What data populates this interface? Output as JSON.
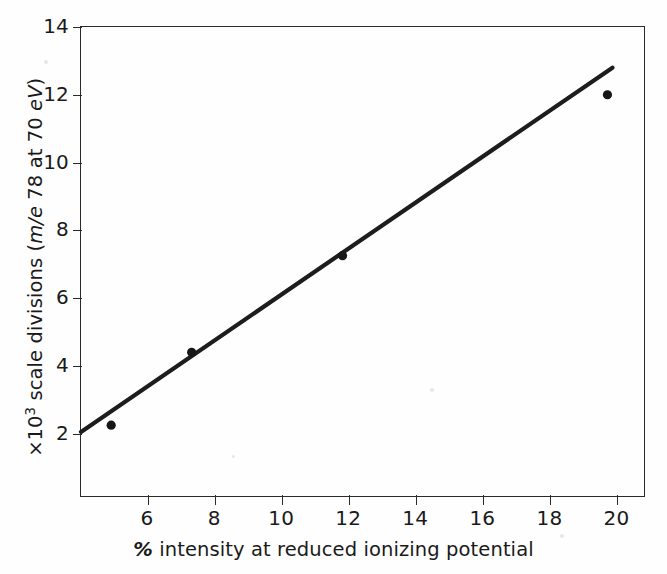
{
  "figure": {
    "background_color": "#fefefe",
    "ink_color": "#2a2a2a"
  },
  "chart_data": {
    "type": "scatter",
    "title": "",
    "subtitle": "",
    "xlabel": "% intensity at reduced ionizing potential",
    "ylabel": "×10³ scale divisions (m/e 78 at 70 eV)",
    "ylabel_parts": {
      "prefix": "×10",
      "exponent": "3",
      "middle": " scale divisions (",
      "italic_1": "m/e",
      "middle_2": " 78 at 70 ",
      "italic_2": "eV",
      "suffix": ")"
    },
    "xlabel_parts": {
      "symbol": "%",
      "rest": " intensity at reduced ionizing potential"
    },
    "x": [
      4.9,
      7.3,
      11.8,
      19.7
    ],
    "y": [
      2.25,
      4.4,
      7.25,
      12.0
    ],
    "points": [
      {
        "x": 4.9,
        "y": 2.25
      },
      {
        "x": 7.3,
        "y": 4.4
      },
      {
        "x": 11.8,
        "y": 7.25
      },
      {
        "x": 19.7,
        "y": 12.0
      }
    ],
    "series": [
      {
        "name": "measurements",
        "marker": "filled-circle",
        "color": "#171717",
        "values": [
          2.25,
          4.4,
          7.25,
          12.0
        ]
      },
      {
        "name": "fitted straight line",
        "type": "line",
        "color": "#1d1d1d",
        "endpoints": [
          {
            "x": 4.0,
            "y": 2.05
          },
          {
            "x": 19.85,
            "y": 12.8
          }
        ]
      }
    ],
    "xlim": [
      4.0,
      20.85
    ],
    "ylim": [
      0.1,
      14.0
    ],
    "xticks": [
      6,
      8,
      10,
      12,
      14,
      16,
      18,
      20
    ],
    "xticklabels": [
      "6",
      "8",
      "10",
      "12",
      "14",
      "16",
      "18",
      "20"
    ],
    "yticks": [
      2,
      4,
      6,
      8,
      10,
      12,
      14
    ],
    "yticklabels": [
      "2",
      "4",
      "6",
      "8",
      "10",
      "12",
      "14"
    ],
    "grid": false,
    "legend": null,
    "legend_position": "none",
    "annotations": [],
    "frame": "full-box"
  }
}
